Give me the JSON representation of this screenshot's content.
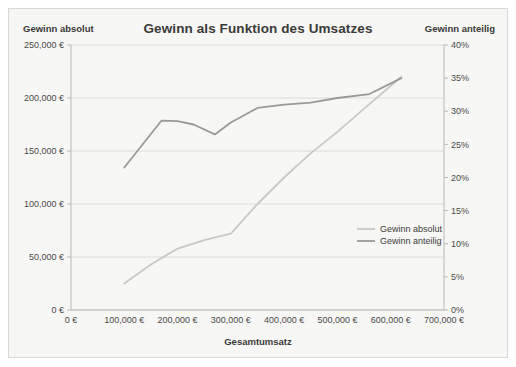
{
  "chart_data": {
    "type": "line",
    "title": "Gewinn als Funktion des Umsatzes",
    "xlabel": "Gesamtumsatz",
    "ylabel": "Gewinn absolut",
    "y2label": "Gewinn anteilig",
    "grid": true,
    "legend_position": "inside-right",
    "xlim": [
      0,
      700000
    ],
    "ylim": [
      0,
      250000
    ],
    "y2lim": [
      0,
      0.4
    ],
    "xticks": [
      0,
      100000,
      200000,
      300000,
      400000,
      500000,
      600000,
      700000
    ],
    "xticklabels": [
      "0 €",
      "100,000 €",
      "200,000 €",
      "300,000 €",
      "400,000 €",
      "500,000 €",
      "600,000 €",
      "700,000 €"
    ],
    "yticks": [
      0,
      50000,
      100000,
      150000,
      200000,
      250000
    ],
    "yticklabels": [
      "0 €",
      "50,000 €",
      "100,000 €",
      "150,000 €",
      "200,000 €",
      "250,000 €"
    ],
    "y2ticks": [
      0,
      0.05,
      0.1,
      0.15,
      0.2,
      0.25,
      0.3,
      0.35,
      0.4
    ],
    "y2ticklabels": [
      "0%",
      "5%",
      "10%",
      "15%",
      "20%",
      "25%",
      "30%",
      "35%",
      "40%"
    ],
    "series": [
      {
        "name": "Gewinn absolut",
        "axis": "left",
        "color": "#c9c9c4",
        "x": [
          100000,
          150000,
          200000,
          250000,
          300000,
          350000,
          400000,
          450000,
          500000,
          550000,
          620000
        ],
        "values": [
          25000,
          43000,
          58000,
          66000,
          72000,
          100000,
          125000,
          148000,
          168000,
          190000,
          220000
        ]
      },
      {
        "name": "Gewinn anteilig",
        "axis": "right",
        "color": "#9a9a95",
        "x": [
          100000,
          170000,
          200000,
          230000,
          270000,
          300000,
          350000,
          400000,
          450000,
          500000,
          560000,
          620000
        ],
        "values": [
          0.215,
          0.286,
          0.285,
          0.28,
          0.265,
          0.283,
          0.305,
          0.31,
          0.313,
          0.32,
          0.326,
          0.35
        ]
      }
    ]
  },
  "legend": {
    "items": [
      {
        "label": "Gewinn absolut",
        "color": "#c9c9c4"
      },
      {
        "label": "Gewinn anteilig",
        "color": "#9a9a95"
      }
    ]
  },
  "colors": {
    "card_background": "#f7f7f5",
    "card_border": "#d8d8d4",
    "grid": "#d5d5d0",
    "axis": "#b8b8b3",
    "text": "#3a3a38"
  }
}
